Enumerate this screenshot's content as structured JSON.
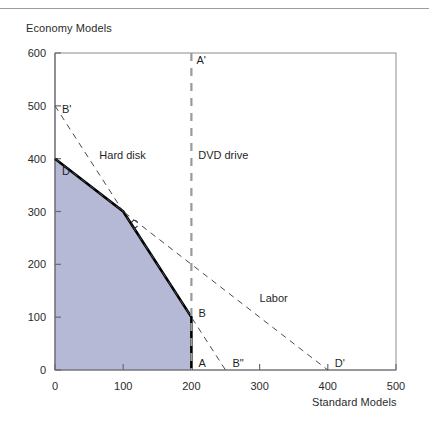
{
  "figure": {
    "y_axis_title": "Economy Models",
    "x_axis_title": "Standard Models"
  },
  "chart_data": {
    "type": "line",
    "title": "",
    "xlabel": "Standard Models",
    "ylabel": "Economy Models",
    "xlim": [
      0,
      500
    ],
    "ylim": [
      0,
      600
    ],
    "xticks": [
      0,
      100,
      200,
      300,
      400,
      500
    ],
    "yticks": [
      0,
      100,
      200,
      300,
      400,
      500,
      600
    ],
    "xtick_labels": [
      "0",
      "100",
      "200",
      "300",
      "400",
      "500"
    ],
    "ytick_labels": [
      "0",
      "100",
      "200",
      "300",
      "400",
      "500",
      "600"
    ],
    "grid": false,
    "legend": "none",
    "series": [
      {
        "name": "Feasible region boundary",
        "style": "solid-thick",
        "color": "#000000",
        "points": [
          [
            0,
            400
          ],
          [
            100,
            300
          ],
          [
            200,
            100
          ],
          [
            200,
            0
          ]
        ]
      },
      {
        "name": "Hard disk",
        "style": "dashed",
        "color": "#4a4a4a",
        "points": [
          [
            0,
            500
          ],
          [
            250,
            0
          ]
        ]
      },
      {
        "name": "Labor",
        "style": "dashed",
        "color": "#4a4a4a",
        "points": [
          [
            0,
            400
          ],
          [
            400,
            0
          ]
        ]
      },
      {
        "name": "DVD drive",
        "style": "dashed-thick",
        "color": "#9a9a9a",
        "points": [
          [
            200,
            600
          ],
          [
            200,
            0
          ]
        ]
      }
    ],
    "shaded_region": {
      "name": "feasible-region",
      "color": "#b5b9d6",
      "points": [
        [
          0,
          0
        ],
        [
          0,
          400
        ],
        [
          100,
          300
        ],
        [
          200,
          100
        ],
        [
          200,
          0
        ]
      ]
    },
    "annotations": [
      {
        "text": "A'",
        "x": 200,
        "y": 580,
        "dx": 5,
        "dy": 0
      },
      {
        "text": "B'",
        "x": 0,
        "y": 505,
        "dx": 7,
        "dy": 10
      },
      {
        "text": "D",
        "x": 0,
        "y": 400,
        "dx": 7,
        "dy": 16
      },
      {
        "text": "C",
        "x": 100,
        "y": 300,
        "dx": 7,
        "dy": 16
      },
      {
        "text": "B",
        "x": 200,
        "y": 100,
        "dx": 7,
        "dy": 0
      },
      {
        "text": "A",
        "x": 200,
        "y": 0,
        "dx": 7,
        "dy": -3
      },
      {
        "text": "B\"",
        "x": 250,
        "y": 0,
        "dx": 7,
        "dy": -3
      },
      {
        "text": "D'",
        "x": 400,
        "y": 0,
        "dx": 7,
        "dy": -3
      },
      {
        "text": "Hard disk",
        "x": 65,
        "y": 400,
        "dx": 0,
        "dy": 0
      },
      {
        "text": "DVD drive",
        "x": 210,
        "y": 400,
        "dx": 0,
        "dy": 0
      },
      {
        "text": "Labor",
        "x": 300,
        "y": 128,
        "dx": 0,
        "dy": 0
      }
    ]
  }
}
